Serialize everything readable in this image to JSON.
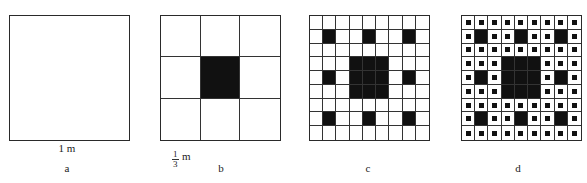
{
  "panels": [
    {
      "id": "a",
      "caption": "a",
      "divisions": 1,
      "dimension_label": "1 m"
    },
    {
      "id": "b",
      "caption": "b",
      "divisions": 3,
      "dimension_label": {
        "numerator": "1",
        "denominator": "3",
        "unit": "m"
      }
    },
    {
      "id": "c",
      "caption": "c",
      "divisions": 9
    },
    {
      "id": "d",
      "caption": "d",
      "divisions": 9,
      "sub_dots": true
    }
  ],
  "colors": {
    "fill": "#111111",
    "line": "#2a2a2a",
    "background": "#ffffff"
  }
}
